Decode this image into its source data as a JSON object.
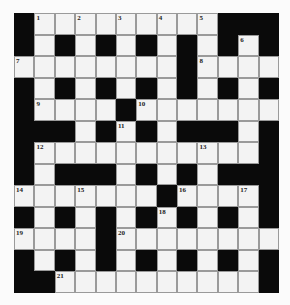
{
  "puzzle": {
    "rows": 13,
    "cols": 13,
    "colors": {
      "block": "#0a0a0a",
      "cell": "#f3f3f3",
      "border": "#9a9a9a",
      "number": "#222222"
    },
    "grid": [
      "#.........###",
      "#.#.#.#.#.#.#",
      "........#....",
      "#.#.#.#.#.#.#",
      "#....#.......",
      "###.#.#.###.#",
      "#...........#",
      "#.###.#.#.###",
      ".......#....#",
      "#.#.#.#.#.#.#",
      "....#........",
      "#.#.#.#.#.#.#",
      "##..........#"
    ],
    "numbers": [
      {
        "n": "1",
        "r": 0,
        "c": 1
      },
      {
        "n": "2",
        "r": 0,
        "c": 3
      },
      {
        "n": "3",
        "r": 0,
        "c": 5
      },
      {
        "n": "4",
        "r": 0,
        "c": 7
      },
      {
        "n": "5",
        "r": 0,
        "c": 9
      },
      {
        "n": "6",
        "r": 1,
        "c": 11
      },
      {
        "n": "7",
        "r": 2,
        "c": 0
      },
      {
        "n": "8",
        "r": 2,
        "c": 9
      },
      {
        "n": "9",
        "r": 4,
        "c": 1
      },
      {
        "n": "10",
        "r": 4,
        "c": 6
      },
      {
        "n": "11",
        "r": 5,
        "c": 5
      },
      {
        "n": "12",
        "r": 6,
        "c": 1
      },
      {
        "n": "13",
        "r": 6,
        "c": 9
      },
      {
        "n": "14",
        "r": 8,
        "c": 0
      },
      {
        "n": "15",
        "r": 8,
        "c": 3
      },
      {
        "n": "16",
        "r": 8,
        "c": 8
      },
      {
        "n": "17",
        "r": 8,
        "c": 11
      },
      {
        "n": "18",
        "r": 9,
        "c": 7
      },
      {
        "n": "19",
        "r": 10,
        "c": 0
      },
      {
        "n": "20",
        "r": 10,
        "c": 5
      },
      {
        "n": "21",
        "r": 12,
        "c": 2
      }
    ]
  }
}
